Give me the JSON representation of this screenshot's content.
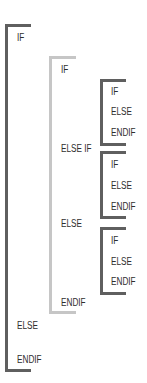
{
  "diagram": {
    "colors": {
      "outer": "#5f5f5f",
      "middle": "#c6c6c6",
      "inner": "#5f5f5f",
      "text": "#2e2e2e"
    },
    "outer": {
      "if": "IF",
      "else": "ELSE",
      "endif": "ENDIF"
    },
    "middle": {
      "if": "IF",
      "elseif": "ELSE IF",
      "else": "ELSE",
      "endif": "ENDIF"
    },
    "inner": [
      {
        "if": "IF",
        "else": "ELSE",
        "endif": "ENDIF"
      },
      {
        "if": "IF",
        "else": "ELSE",
        "endif": "ENDIF"
      },
      {
        "if": "IF",
        "else": "ELSE",
        "endif": "ENDIF"
      }
    ]
  }
}
